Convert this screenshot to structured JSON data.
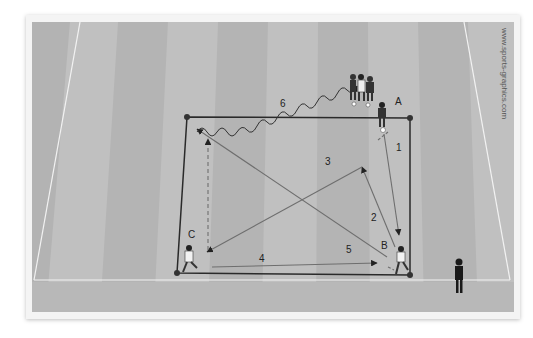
{
  "diagram": {
    "type": "soccer-drill",
    "watermark": "www.sports-graphics.com",
    "colors": {
      "pitch_light": "#c2c2c2",
      "pitch_dark": "#b2b2b2",
      "lines": "#2a2a2a",
      "pass_arrow": "#6e6e6e",
      "pitch_marking": "#f2f2f2"
    },
    "players": [
      {
        "id": "A",
        "label": "A"
      },
      {
        "id": "B",
        "label": "B"
      },
      {
        "id": "C",
        "label": "C"
      }
    ],
    "coach": {
      "label": "coach"
    },
    "passes": [
      {
        "number": "1",
        "from": "A",
        "to": "B",
        "style": "solid"
      },
      {
        "number": "2",
        "from": "B",
        "to": "A-area",
        "style": "solid"
      },
      {
        "number": "3",
        "from": "A-area",
        "to": "C",
        "style": "solid"
      },
      {
        "number": "4",
        "from": "C",
        "to": "B",
        "style": "solid"
      },
      {
        "number": "5",
        "from": "B",
        "to": "top-left corner",
        "style": "solid"
      },
      {
        "number": "6",
        "from": "top-left corner",
        "to": "queue",
        "style": "dribble"
      }
    ],
    "labels": {
      "a": "A",
      "b": "B",
      "c": "C",
      "p1": "1",
      "p2": "2",
      "p3": "3",
      "p4": "4",
      "p5": "5",
      "p6": "6"
    }
  }
}
